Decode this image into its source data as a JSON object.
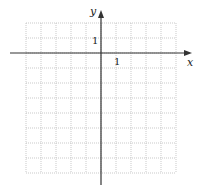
{
  "diagram": {
    "type": "coordinate-grid",
    "axes": {
      "x_label": "x",
      "y_label": "y",
      "x_tick_label": "1",
      "y_tick_label": "1"
    },
    "grid": {
      "columns": 10,
      "rows": 10,
      "x_range": [
        -5,
        5
      ],
      "y_range": [
        -8,
        2
      ],
      "line_style": "dotted",
      "grid_color": "#bbbbbb",
      "axis_color": "#333333"
    }
  }
}
